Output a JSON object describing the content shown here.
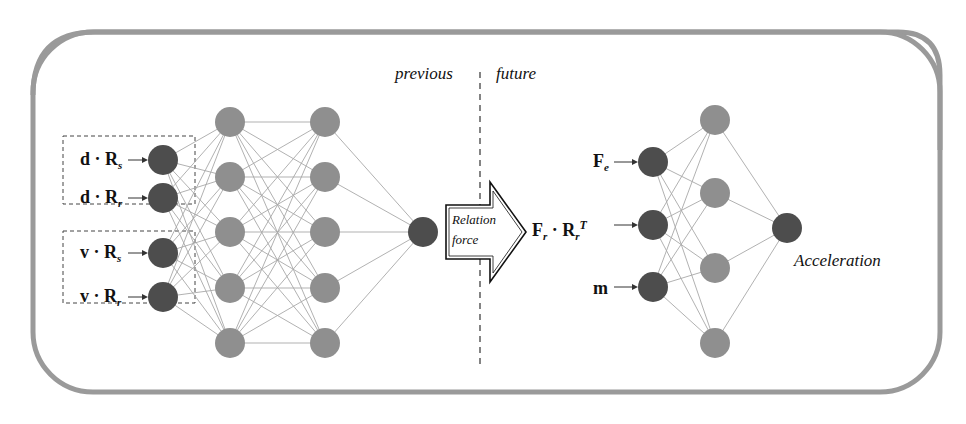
{
  "labels": {
    "previous": "previous",
    "future": "future",
    "relation_line1": "Relation",
    "relation_line2": "force",
    "acceleration": "Acceleration"
  },
  "left_inputs": [
    {
      "vec": "d",
      "dot": "·",
      "mat": "R",
      "sub": "s"
    },
    {
      "vec": "d",
      "dot": "·",
      "mat": "R",
      "sub": "r"
    },
    {
      "vec": "v",
      "dot": "·",
      "mat": "R",
      "sub": "s"
    },
    {
      "vec": "v",
      "dot": "·",
      "mat": "R",
      "sub": "r"
    }
  ],
  "right_inputs": [
    {
      "main": "F",
      "sub": "e",
      "dot": "",
      "mat": "",
      "mat_sub": "",
      "sup": ""
    },
    {
      "main": "F",
      "sub": "r",
      "dot": "·",
      "mat": "R",
      "mat_sub": "r",
      "sup": "T"
    },
    {
      "main": "m",
      "sub": "",
      "dot": "",
      "mat": "",
      "mat_sub": "",
      "sup": ""
    }
  ],
  "colors": {
    "dark_node": "#4d4d4d",
    "light_node": "#8f8f8f",
    "frame": "#9a9a9a",
    "edge": "#a8a8a8"
  },
  "networks": {
    "left": {
      "layers": [
        4,
        5,
        5,
        1
      ]
    },
    "right": {
      "layers": [
        3,
        4,
        1
      ]
    }
  }
}
